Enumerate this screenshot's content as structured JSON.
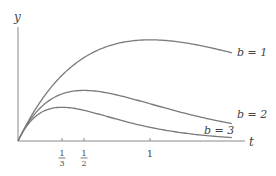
{
  "chart_data": {
    "type": "line",
    "title": "",
    "xlabel": "t",
    "ylabel": "y",
    "function": "y = t * exp(-b t)",
    "xlim": [
      0,
      1.72
    ],
    "ylim": [
      0,
      0.41
    ],
    "grid": false,
    "legend": "inline labels at right end of curves",
    "x_ticks": [
      {
        "value": 0.3333,
        "label_num": "1",
        "label_den": "3"
      },
      {
        "value": 0.5,
        "label_num": "1",
        "label_den": "2"
      },
      {
        "value": 1,
        "label": "1"
      }
    ],
    "series": [
      {
        "name": "b = 1",
        "b": 1,
        "peak": {
          "t": 1.0,
          "y": 0.368
        },
        "x": [
          0,
          0.25,
          0.5,
          0.75,
          1.0,
          1.25,
          1.5,
          1.62
        ],
        "values": [
          0,
          0.195,
          0.303,
          0.354,
          0.368,
          0.358,
          0.335,
          0.32
        ]
      },
      {
        "name": "b = 2",
        "b": 2,
        "peak": {
          "t": 0.5,
          "y": 0.184
        },
        "x": [
          0,
          0.25,
          0.5,
          0.75,
          1.0,
          1.25,
          1.5,
          1.62
        ],
        "values": [
          0,
          0.152,
          0.184,
          0.167,
          0.135,
          0.103,
          0.075,
          0.063
        ]
      },
      {
        "name": "b = 3",
        "b": 3,
        "peak": {
          "t": 0.3333,
          "y": 0.123
        },
        "x": [
          0,
          0.25,
          0.5,
          0.75,
          1.0,
          1.25,
          1.5,
          1.62
        ],
        "values": [
          0,
          0.118,
          0.112,
          0.079,
          0.05,
          0.029,
          0.017,
          0.013
        ]
      }
    ]
  },
  "labels": {
    "y_axis": "y",
    "x_axis": "t",
    "b1": "b = 1",
    "b2": "b = 2",
    "b3": "b = 3",
    "tick_third_num": "1",
    "tick_third_den": "3",
    "tick_half_num": "1",
    "tick_half_den": "2",
    "tick_one": "1"
  },
  "style": {
    "curve_color": "#7a7a7a",
    "axis_color": "#8a8a8a",
    "text_color": "#444444"
  }
}
